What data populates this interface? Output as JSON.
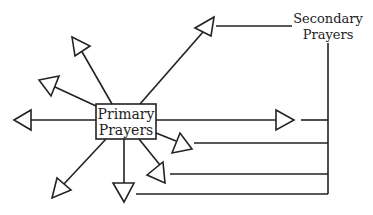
{
  "primary_box": {
    "line1": "Primary",
    "line2": "Prayers"
  },
  "secondary_label": {
    "line1": "Secondary",
    "line2": "Prayers"
  },
  "colors": {
    "stroke": "#222222",
    "background": "#ffffff"
  },
  "arrows": [
    {
      "direction": "up-right",
      "connected_to_secondary": true
    },
    {
      "direction": "up-left",
      "connected_to_secondary": false
    },
    {
      "direction": "left-up",
      "connected_to_secondary": false
    },
    {
      "direction": "left",
      "connected_to_secondary": false
    },
    {
      "direction": "down-left",
      "connected_to_secondary": false
    },
    {
      "direction": "down",
      "connected_to_secondary": true
    },
    {
      "direction": "down-right",
      "connected_to_secondary": true
    },
    {
      "direction": "right-down",
      "connected_to_secondary": true
    },
    {
      "direction": "right",
      "connected_to_secondary": true
    }
  ]
}
